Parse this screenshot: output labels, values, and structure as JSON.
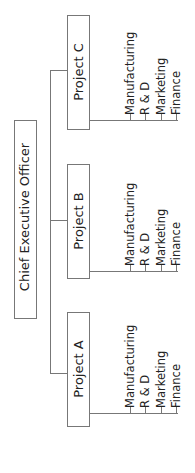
{
  "chart_title": "",
  "ceo": {
    "label": "Chief Executive Officer"
  },
  "projects": [
    {
      "label": "Project C",
      "departments": [
        "Manufacturing",
        "R & D",
        "Marketing",
        "Finance"
      ]
    },
    {
      "label": "Project B",
      "departments": [
        "Manufacturing",
        "R & D",
        "Marketing",
        "Finance"
      ]
    },
    {
      "label": "Project A",
      "departments": [
        "Manufacturing",
        "R & D",
        "Marketing",
        "Finance"
      ]
    }
  ],
  "colors": {
    "line": "#777777",
    "text": "#222222",
    "background": "#ffffff"
  }
}
